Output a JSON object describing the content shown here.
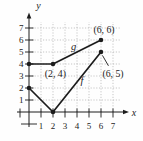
{
  "figure": {
    "background": "#fefefe",
    "ink_color": "#1c1c1c",
    "grid_color": "#b0b0b0"
  },
  "chart_data": {
    "type": "line",
    "title": "",
    "xlabel": "x",
    "ylabel": "y",
    "xlim": [
      -1,
      7.8
    ],
    "ylim": [
      -1.3,
      8.2
    ],
    "grid": true,
    "x_ticks": [
      "1",
      "2",
      "3",
      "4",
      "5",
      "6",
      "7"
    ],
    "y_ticks": [
      "1",
      "2",
      "3",
      "4",
      "5",
      "6",
      "7"
    ],
    "series": [
      {
        "name": "g",
        "label": "g",
        "points": [
          [
            0,
            4
          ],
          [
            2,
            4
          ],
          [
            6,
            6
          ]
        ],
        "markers": [
          [
            0,
            4
          ],
          [
            2,
            4
          ],
          [
            6,
            6
          ]
        ],
        "label_at": [
          3.72,
          5.2
        ]
      },
      {
        "name": "f",
        "label": "f",
        "points": [
          [
            0,
            2
          ],
          [
            2,
            0
          ],
          [
            6,
            5
          ]
        ],
        "markers": [
          [
            0,
            2
          ],
          [
            2,
            0
          ],
          [
            6,
            5
          ]
        ],
        "label_at": [
          4.42,
          2.3
        ]
      }
    ],
    "annotations": [
      {
        "text": "(2, 4)",
        "at": [
          2.2,
          2.9
        ]
      },
      {
        "text": "(6, 6)",
        "at": [
          6.25,
          6.6
        ]
      },
      {
        "text": "(6, 5)",
        "at": [
          7.0,
          2.9
        ],
        "leader": [
          [
            6.12,
            4.72
          ],
          [
            6.62,
            3.85
          ]
        ]
      }
    ]
  }
}
